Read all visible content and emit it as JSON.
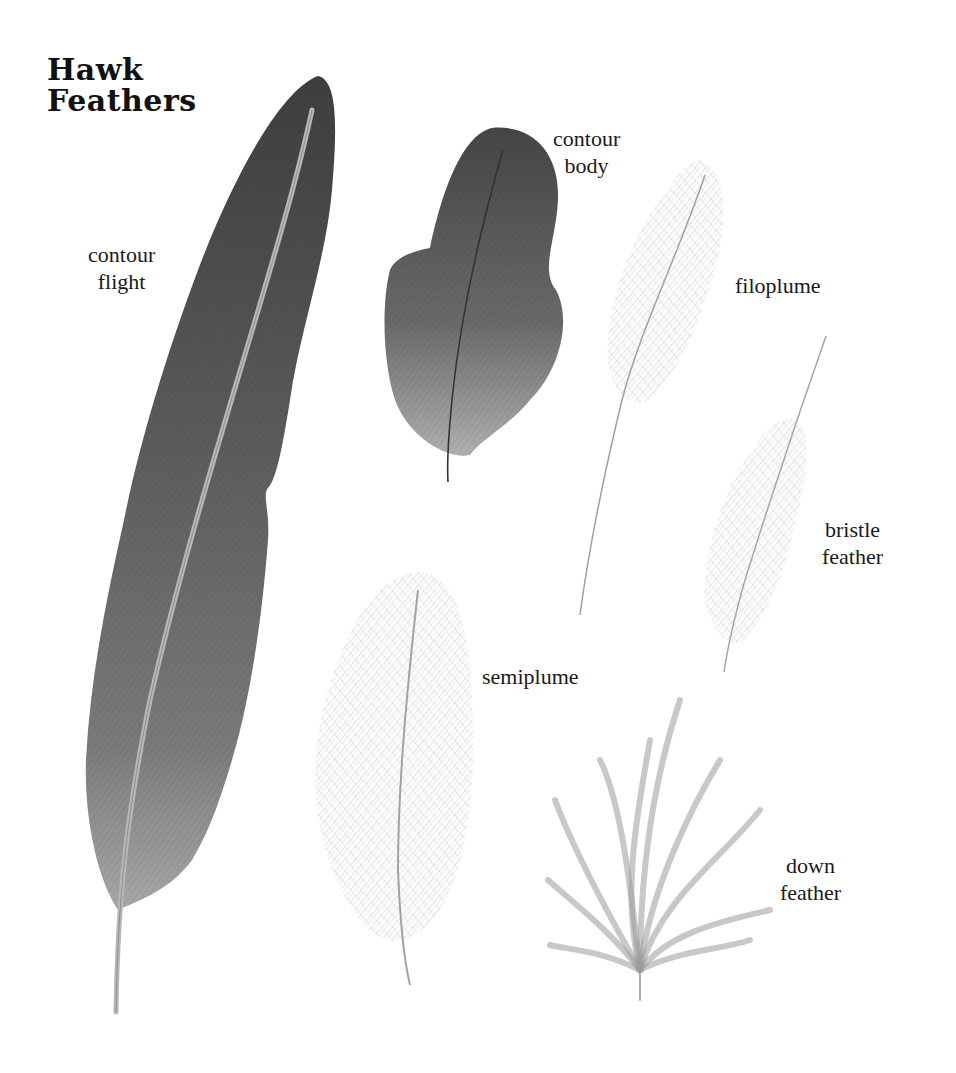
{
  "title": {
    "line1": "Hawk",
    "line2": "Feathers"
  },
  "labels": [
    {
      "id": "contour-flight",
      "line1": "contour",
      "line2": "flight"
    },
    {
      "id": "contour-body",
      "line1": "contour",
      "line2": "body"
    },
    {
      "id": "filoplume",
      "line1": "filoplume"
    },
    {
      "id": "bristle-feather",
      "line1": "bristle",
      "line2": "feather"
    },
    {
      "id": "semiplume",
      "line1": "semiplume"
    },
    {
      "id": "down-feather",
      "line1": "down",
      "line2": "feather"
    }
  ],
  "colors": {
    "background": "#ffffff",
    "text": "#1a1a1a",
    "contour_dark": "#4a4a4a",
    "contour_mid": "#6e6e6e",
    "contour_light": "#9a9a9a",
    "plume_gray": "#a8a8a8",
    "shaft": "#b5b5b5"
  }
}
